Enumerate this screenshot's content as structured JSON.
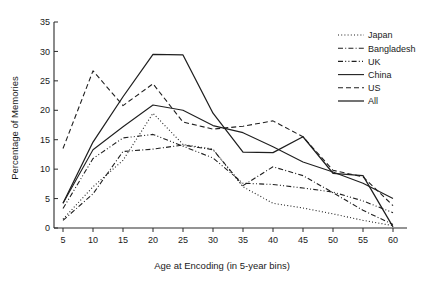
{
  "chart_data": {
    "type": "line",
    "title": "",
    "xlabel": "Age at Encoding (in 5-year bins)",
    "ylabel": "Percentage of Memories",
    "x": [
      5,
      10,
      15,
      20,
      25,
      30,
      35,
      40,
      45,
      50,
      55,
      60
    ],
    "xlim": [
      5,
      60
    ],
    "ylim": [
      0,
      35
    ],
    "xticks": [
      "5",
      "10",
      "15",
      "20",
      "25",
      "30",
      "35",
      "40",
      "45",
      "50",
      "55",
      "60"
    ],
    "yticks": [
      "0",
      "5",
      "10",
      "15",
      "20",
      "25",
      "30",
      "35"
    ],
    "grid": false,
    "legend_position": "top-right",
    "series": [
      {
        "name": "Japan",
        "style": "dotted",
        "values": [
          1.5,
          7.0,
          11.5,
          19.5,
          14.2,
          13.4,
          7.0,
          4.2,
          3.4,
          2.4,
          1.3,
          0.4
        ]
      },
      {
        "name": "Bangladesh",
        "style": "dash-dot",
        "values": [
          1.3,
          5.8,
          13.0,
          13.4,
          14.1,
          13.3,
          7.2,
          10.4,
          8.9,
          6.0,
          3.0,
          0.6
        ]
      },
      {
        "name": "UK",
        "style": "dash-dot-dot",
        "values": [
          3.3,
          11.8,
          15.3,
          15.9,
          13.9,
          11.9,
          7.6,
          7.4,
          6.8,
          6.1,
          4.6,
          2.6
        ]
      },
      {
        "name": "China",
        "style": "solid",
        "values": [
          4.2,
          13.3,
          17.2,
          20.9,
          20.0,
          17.4,
          16.2,
          13.8,
          11.2,
          9.5,
          7.6,
          5.0
        ]
      },
      {
        "name": "US",
        "style": "dashed",
        "values": [
          13.5,
          26.7,
          20.8,
          24.5,
          18.0,
          16.8,
          17.3,
          18.2,
          15.5,
          9.8,
          8.7,
          3.8
        ]
      },
      {
        "name": "All",
        "style": "solid",
        "values": [
          4.2,
          14.6,
          22.3,
          29.5,
          29.4,
          19.5,
          12.9,
          12.8,
          15.5,
          9.3,
          8.9,
          0.2
        ]
      }
    ]
  },
  "legend": {
    "items": [
      {
        "label": "Japan"
      },
      {
        "label": "Bangladesh"
      },
      {
        "label": "UK"
      },
      {
        "label": "China"
      },
      {
        "label": "US"
      },
      {
        "label": "All"
      }
    ]
  },
  "axes": {
    "x_title": "Age at Encoding (in 5-year bins)",
    "y_title": "Percentage of Memories"
  },
  "colors": {
    "ink": "#1f1f1f",
    "axis": "#2b2b2b",
    "background": "#ffffff"
  }
}
